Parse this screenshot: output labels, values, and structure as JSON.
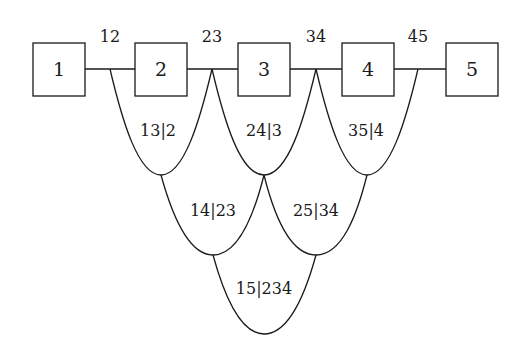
{
  "diagram": {
    "type": "tree-decomposition / junction-lattice",
    "nodes": [
      {
        "id": "1",
        "label": "1",
        "x": 33,
        "y": 43,
        "w": 52,
        "h": 53
      },
      {
        "id": "2",
        "label": "2",
        "x": 135,
        "y": 43,
        "w": 52,
        "h": 53
      },
      {
        "id": "3",
        "label": "3",
        "x": 238,
        "y": 43,
        "w": 52,
        "h": 53
      },
      {
        "id": "4",
        "label": "4",
        "x": 342,
        "y": 43,
        "w": 52,
        "h": 53
      },
      {
        "id": "5",
        "label": "5",
        "x": 446,
        "y": 43,
        "w": 52,
        "h": 53
      }
    ],
    "edge_labels": [
      {
        "label": "12",
        "x": 110
      },
      {
        "label": "23",
        "x": 212
      },
      {
        "label": "34",
        "x": 316
      },
      {
        "label": "45",
        "x": 418
      }
    ],
    "regions": [
      {
        "label": "13|2",
        "level": 1
      },
      {
        "label": "24|3",
        "level": 1
      },
      {
        "label": "35|4",
        "level": 1
      },
      {
        "label": "14|23",
        "level": 2
      },
      {
        "label": "25|34",
        "level": 2
      },
      {
        "label": "15|234",
        "level": 3
      }
    ],
    "stroke_color": "#1a1a1a",
    "background": "#ffffff"
  }
}
